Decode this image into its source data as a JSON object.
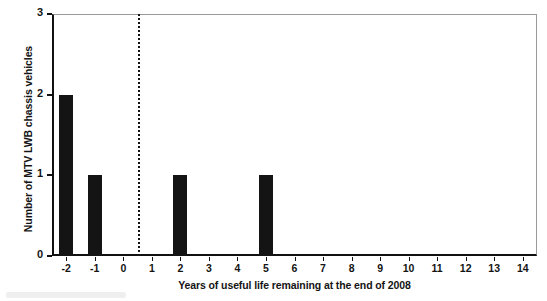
{
  "figure": {
    "background_color": "#ffffff",
    "bar_color": "#141414",
    "axis_color": "#111111",
    "frame_color": "#9a9a9a"
  },
  "chart_data": {
    "type": "bar",
    "title": "",
    "xlabel": "Years of useful life remaining at the end of 2008",
    "ylabel": "Number of MTV LWB chassis vehicles",
    "categories": [
      "-2",
      "-1",
      "0",
      "1",
      "2",
      "3",
      "4",
      "5",
      "6",
      "7",
      "8",
      "9",
      "10",
      "11",
      "12",
      "13",
      "14"
    ],
    "values": [
      2,
      1,
      0,
      0,
      1,
      0,
      0,
      1,
      0,
      0,
      0,
      0,
      0,
      0,
      0,
      0,
      0
    ],
    "xlim": [
      -2.5,
      14.5
    ],
    "ylim": [
      0,
      3
    ],
    "xticks": [
      "-2",
      "-1",
      "0",
      "1",
      "2",
      "3",
      "4",
      "5",
      "6",
      "7",
      "8",
      "9",
      "10",
      "11",
      "12",
      "13",
      "14"
    ],
    "yticks": [
      "0",
      "1",
      "2",
      "3"
    ],
    "grid": false,
    "legend": false,
    "annotations": [
      {
        "name": "reference-line",
        "kind": "vertical-dashed-line",
        "x_value": 0.5,
        "style": "dotted",
        "color": "#151515"
      }
    ]
  }
}
